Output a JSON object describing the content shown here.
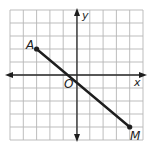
{
  "diagram": {
    "type": "coordinate-plane",
    "grid": {
      "cells_x": 10,
      "cells_y": 10,
      "x_range": [
        -5,
        5
      ],
      "y_range": [
        -5,
        5
      ]
    },
    "axes": {
      "x_label": "x",
      "y_label": "y",
      "origin_label": "O"
    },
    "segment": {
      "from": {
        "label": "A",
        "x": -3,
        "y": 2
      },
      "to": {
        "label": "M",
        "x": 4,
        "y": -4
      }
    },
    "colors": {
      "grid": "#b5b5b5",
      "axis": "#2a2a2a",
      "segment": "#1e1e1e",
      "background": "#ffffff"
    }
  }
}
